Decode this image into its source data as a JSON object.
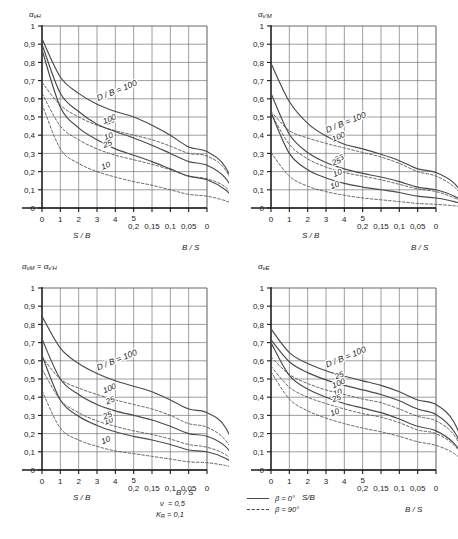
{
  "figure": {
    "axis_names": {
      "lower_left": "S / B",
      "lower_right": "B / S"
    },
    "x_ticks_left": [
      "0",
      "1",
      "2",
      "3",
      "4",
      "5"
    ],
    "x_ticks_right": [
      "0,2",
      "0,15",
      "0,1",
      "0,05",
      "0"
    ],
    "y_ticks": [
      "0",
      "0,1",
      "0,2",
      "0,3",
      "0,4",
      "0,5",
      "0,6",
      "0,7",
      "0,8",
      "0,9",
      "1"
    ],
    "curve_label_prefix": "D / B = 100",
    "curve_labels": [
      "25",
      "100",
      "10",
      "25",
      "10"
    ],
    "parameters": {
      "nu_label": "ν",
      "nu_value": "= 0,5",
      "kr_label": "K",
      "kr_sub": "R",
      "kr_value": "= 0,1"
    },
    "legend": [
      {
        "style": "solid",
        "label": "β = 0°"
      },
      {
        "style": "dashed",
        "label": "β = 90°"
      }
    ],
    "colors": {
      "curve": "#4a4a4a",
      "grid": "#6b6b6b",
      "axis": "#1a1a1a",
      "text": "#1a1a1a"
    }
  },
  "chart_data": [
    {
      "id": "alpha-nu-H",
      "type": "line",
      "title": "ανH",
      "ylabel": "ανH",
      "xlabel_left": "S / B",
      "xlabel_right": "B / S",
      "xlim_left": [
        0,
        5
      ],
      "xlim_right": [
        0.2,
        0
      ],
      "ylim": [
        0,
        1
      ],
      "grid": true,
      "x_left": [
        0,
        1,
        2,
        3,
        4,
        5
      ],
      "x_right": [
        0.2,
        0.15,
        0.1,
        0.05,
        0
      ],
      "series": [
        {
          "name": "D/B = 100, β = 0°",
          "style": "solid",
          "values": [
            0.93,
            0.72,
            0.63,
            0.57,
            0.53,
            0.5,
            0.455,
            0.4,
            0.335,
            0.31,
            0.225,
            0.0
          ]
        },
        {
          "name": "D/B = 25, β = 0°",
          "style": "solid",
          "values": [
            0.9,
            0.63,
            0.53,
            0.46,
            0.42,
            0.385,
            0.345,
            0.3,
            0.255,
            0.235,
            0.165,
            0.0
          ]
        },
        {
          "name": "D/B = 10, β = 0°",
          "style": "solid",
          "values": [
            0.87,
            0.555,
            0.44,
            0.375,
            0.325,
            0.29,
            0.255,
            0.215,
            0.175,
            0.155,
            0.1,
            0.0
          ]
        },
        {
          "name": "D/B = 100, β = 90°",
          "style": "dashed",
          "values": [
            0.69,
            0.565,
            0.5,
            0.455,
            0.425,
            0.4,
            0.375,
            0.34,
            0.3,
            0.285,
            0.21,
            0.0
          ]
        },
        {
          "name": "D/B = 25, β = 90°",
          "style": "dashed",
          "values": [
            0.63,
            0.45,
            0.375,
            0.325,
            0.29,
            0.265,
            0.24,
            0.21,
            0.175,
            0.16,
            0.115,
            0.0
          ]
        },
        {
          "name": "D/B = 10, β = 90°",
          "style": "dashed",
          "values": [
            0.57,
            0.325,
            0.245,
            0.2,
            0.17,
            0.145,
            0.125,
            0.1,
            0.075,
            0.065,
            0.04,
            0.0
          ]
        }
      ]
    },
    {
      "id": "alpha-nu-prime-M",
      "type": "line",
      "title": "αν'M",
      "ylabel": "αν'M",
      "xlabel_left": "S / B",
      "xlabel_right": "B / S",
      "xlim_left": [
        0,
        5
      ],
      "xlim_right": [
        0.2,
        0
      ],
      "ylim": [
        0,
        1
      ],
      "grid": true,
      "x_left": [
        0,
        1,
        2,
        3,
        4,
        5
      ],
      "x_right": [
        0.2,
        0.15,
        0.1,
        0.05,
        0
      ],
      "series": [
        {
          "name": "D/B = 100, β = 0°",
          "style": "solid",
          "values": [
            0.795,
            0.585,
            0.465,
            0.395,
            0.35,
            0.325,
            0.295,
            0.26,
            0.215,
            0.195,
            0.135,
            0.0
          ]
        },
        {
          "name": "D/B = 25, β = 0°",
          "style": "solid",
          "values": [
            0.63,
            0.405,
            0.305,
            0.25,
            0.215,
            0.19,
            0.17,
            0.145,
            0.115,
            0.1,
            0.065,
            0.0
          ]
        },
        {
          "name": "D/B = 10, β = 0°",
          "style": "solid",
          "values": [
            0.525,
            0.3,
            0.21,
            0.165,
            0.135,
            0.115,
            0.1,
            0.085,
            0.065,
            0.055,
            0.035,
            0.0
          ]
        },
        {
          "name": "D/B = 100, β = 90°",
          "style": "dashed",
          "values": [
            0.53,
            0.425,
            0.385,
            0.355,
            0.33,
            0.305,
            0.28,
            0.245,
            0.2,
            0.175,
            0.115,
            0.0
          ]
        },
        {
          "name": "D/B = 25, β = 90°",
          "style": "dashed",
          "values": [
            0.52,
            0.35,
            0.27,
            0.225,
            0.195,
            0.175,
            0.155,
            0.13,
            0.105,
            0.09,
            0.055,
            0.0
          ]
        },
        {
          "name": "D/B = 10, β = 90°",
          "style": "dashed",
          "values": [
            0.305,
            0.175,
            0.12,
            0.09,
            0.07,
            0.055,
            0.045,
            0.035,
            0.025,
            0.02,
            0.012,
            0.0
          ]
        }
      ]
    },
    {
      "id": "alpha-nu-M-equals-alpha-nu-prime-H",
      "type": "line",
      "title": "ανM = αν'H",
      "ylabel": "ανM = αν'H",
      "xlabel_left": "S / B",
      "xlabel_right": "B / S",
      "xlim_left": [
        0,
        5
      ],
      "xlim_right": [
        0.2,
        0
      ],
      "ylim": [
        0,
        1
      ],
      "grid": true,
      "x_left": [
        0,
        1,
        2,
        3,
        4,
        5
      ],
      "x_right": [
        0.2,
        0.15,
        0.1,
        0.05,
        0
      ],
      "series": [
        {
          "name": "D/B = 100, β = 0°",
          "style": "solid",
          "values": [
            0.845,
            0.67,
            0.585,
            0.53,
            0.49,
            0.46,
            0.43,
            0.385,
            0.335,
            0.315,
            0.235,
            0.0
          ]
        },
        {
          "name": "D/B = 25, β = 0°",
          "style": "solid",
          "values": [
            0.72,
            0.5,
            0.415,
            0.36,
            0.325,
            0.3,
            0.275,
            0.24,
            0.2,
            0.185,
            0.13,
            0.0
          ]
        },
        {
          "name": "D/B = 10, β = 0°",
          "style": "solid",
          "values": [
            0.63,
            0.385,
            0.295,
            0.245,
            0.21,
            0.185,
            0.165,
            0.14,
            0.11,
            0.1,
            0.065,
            0.0
          ]
        },
        {
          "name": "D/B = 100, β = 90°",
          "style": "dashed",
          "values": [
            0.62,
            0.5,
            0.45,
            0.415,
            0.385,
            0.36,
            0.335,
            0.3,
            0.255,
            0.235,
            0.165,
            0.0
          ]
        },
        {
          "name": "D/B = 25, β = 90°",
          "style": "dashed",
          "values": [
            0.555,
            0.385,
            0.315,
            0.27,
            0.24,
            0.215,
            0.195,
            0.17,
            0.14,
            0.125,
            0.085,
            0.0
          ]
        },
        {
          "name": "D/B = 10, β = 90°",
          "style": "dashed",
          "values": [
            0.435,
            0.23,
            0.165,
            0.13,
            0.105,
            0.09,
            0.075,
            0.06,
            0.045,
            0.04,
            0.025,
            0.0
          ]
        }
      ]
    },
    {
      "id": "alpha-nu-E",
      "type": "line",
      "title": "ανE",
      "ylabel": "ανE",
      "xlabel_left": "S/B",
      "xlabel_right": "B / S",
      "xlim_left": [
        0,
        5
      ],
      "xlim_right": [
        0.2,
        0
      ],
      "ylim": [
        0,
        1
      ],
      "grid": true,
      "x_left": [
        0,
        1,
        2,
        3,
        4,
        5
      ],
      "x_right": [
        0.2,
        0.15,
        0.1,
        0.05,
        0
      ],
      "series": [
        {
          "name": "D/B = 100, β = 0°",
          "style": "solid",
          "values": [
            0.775,
            0.645,
            0.585,
            0.545,
            0.515,
            0.49,
            0.465,
            0.43,
            0.385,
            0.36,
            0.26,
            0.0
          ]
        },
        {
          "name": "D/B = 25, β = 0°",
          "style": "solid",
          "values": [
            0.715,
            0.595,
            0.535,
            0.495,
            0.465,
            0.44,
            0.415,
            0.38,
            0.335,
            0.305,
            0.21,
            0.0
          ]
        },
        {
          "name": "D/B = 10, β = 0°",
          "style": "solid",
          "values": [
            0.7,
            0.52,
            0.445,
            0.4,
            0.365,
            0.34,
            0.315,
            0.28,
            0.24,
            0.215,
            0.145,
            0.0
          ]
        },
        {
          "name": "D/B = 100, β = 90°",
          "style": "dashed",
          "values": [
            0.62,
            0.525,
            0.475,
            0.44,
            0.415,
            0.39,
            0.37,
            0.335,
            0.295,
            0.27,
            0.19,
            0.0
          ]
        },
        {
          "name": "D/B = 25, β = 90°",
          "style": "dashed",
          "values": [
            0.57,
            0.455,
            0.4,
            0.365,
            0.335,
            0.31,
            0.29,
            0.26,
            0.22,
            0.2,
            0.135,
            0.0
          ]
        },
        {
          "name": "D/B = 10, β = 90°",
          "style": "dashed",
          "values": [
            0.54,
            0.39,
            0.325,
            0.285,
            0.255,
            0.23,
            0.21,
            0.185,
            0.155,
            0.135,
            0.09,
            0.0
          ]
        }
      ]
    }
  ]
}
